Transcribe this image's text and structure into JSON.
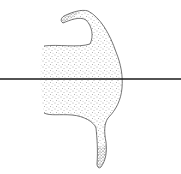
{
  "figure": {
    "colors": {
      "background": "#ffffff",
      "line": "#1a1a1a",
      "outline": "#3a3a3a",
      "stipple": "#555555"
    }
  }
}
